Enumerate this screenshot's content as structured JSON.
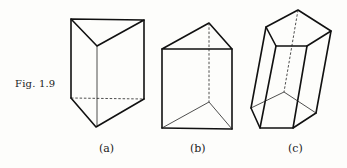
{
  "figure": {
    "label": "Fig. 1.9",
    "subfigures": [
      {
        "id": "a",
        "label": "(a)",
        "shape": "triangular prism"
      },
      {
        "id": "b",
        "label": "(b)",
        "shape": "triangular prism"
      },
      {
        "id": "c",
        "label": "(c)",
        "shape": "pentagonal prism (oblique)"
      }
    ]
  }
}
